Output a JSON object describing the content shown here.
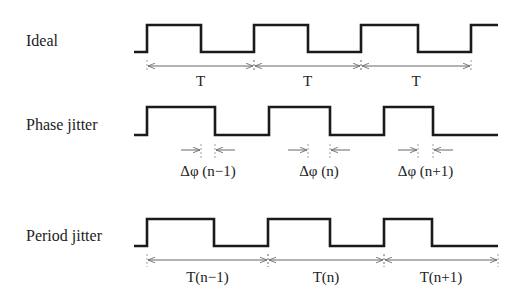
{
  "diagram": {
    "rows": [
      {
        "id": "ideal",
        "label": "Ideal",
        "label_pos": [
          26,
          46
        ],
        "high_y": 25,
        "low_y": 52,
        "start_x": 134,
        "end_x": 498,
        "edges": [
          147,
          201,
          254,
          308,
          361,
          418,
          471
        ],
        "start_level": "low",
        "measure_type": "period",
        "measure_y": 66,
        "tick_top": 60,
        "tick_bottom": 72,
        "measures": [
          {
            "from": 147,
            "to": 254,
            "label": "T"
          },
          {
            "from": 254,
            "to": 361,
            "label": "T"
          },
          {
            "from": 361,
            "to": 471,
            "label": "T"
          }
        ],
        "measure_label_y": 86
      },
      {
        "id": "phase",
        "label": "Phase jitter",
        "label_pos": [
          26,
          130
        ],
        "high_y": 107,
        "low_y": 135,
        "start_x": 134,
        "end_x": 498,
        "edges": [
          147,
          215,
          269,
          330,
          384,
          433
        ],
        "start_level": "low",
        "measure_type": "delta",
        "measure_y": 150,
        "tick_top": 144,
        "tick_bottom": 158,
        "measures": [
          {
            "ideal": 201,
            "actual": 215,
            "label": "Δφ (n−1)"
          },
          {
            "ideal": 308,
            "actual": 330,
            "label": "Δφ (n)"
          },
          {
            "ideal": 418,
            "actual": 433,
            "label": "Δφ (n+1)"
          }
        ],
        "measure_label_y": 176
      },
      {
        "id": "period",
        "label": "Period jitter",
        "label_pos": [
          26,
          241
        ],
        "high_y": 219,
        "low_y": 246,
        "start_x": 134,
        "end_x": 498,
        "edges": [
          147,
          214,
          268,
          330,
          384,
          432
        ],
        "start_level": "low",
        "measure_type": "period",
        "measure_y": 260,
        "tick_top": 254,
        "tick_bottom": 267,
        "measures": [
          {
            "from": 147,
            "to": 268,
            "label": "T(n−1)"
          },
          {
            "from": 268,
            "to": 384,
            "label": "T(n)"
          },
          {
            "from": 384,
            "to": 498,
            "label": "T(n+1)"
          }
        ],
        "measure_label_y": 282
      }
    ],
    "colors": {
      "waveform": "#1a1a1a",
      "dimension": "#666666",
      "text": "#222222",
      "background": "#ffffff"
    }
  }
}
